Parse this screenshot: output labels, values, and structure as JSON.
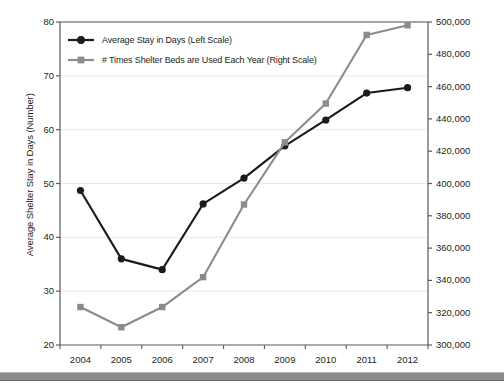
{
  "chart_data": {
    "type": "line",
    "title": "",
    "subtitle": "",
    "xlabel": "",
    "ylabel": "Average Shelter Stay in Days (Number)",
    "y2label": "Annual Number of Times Shelter Beds Used",
    "categories": [
      "2004",
      "2005",
      "2006",
      "2007",
      "2008",
      "2009",
      "2010",
      "2011",
      "2012"
    ],
    "x": [
      2004,
      2005,
      2006,
      2007,
      2008,
      2009,
      2010,
      2011,
      2012
    ],
    "ylim": [
      20,
      80
    ],
    "y2lim": [
      300000,
      500000
    ],
    "yticks": [
      20,
      30,
      40,
      50,
      60,
      70,
      80
    ],
    "y2ticks": [
      300000,
      320000,
      340000,
      360000,
      380000,
      400000,
      420000,
      440000,
      460000,
      480000,
      500000
    ],
    "ytick_labels": [
      "20",
      "30",
      "40",
      "50",
      "60",
      "70",
      "80"
    ],
    "y2tick_labels": [
      "300,000",
      "320,000",
      "340,000",
      "360,000",
      "380,000",
      "400,000",
      "420,000",
      "440,000",
      "460,000",
      "480,000",
      "500,000"
    ],
    "grid": true,
    "legend_position": "top-left",
    "series": [
      {
        "name": "Average Stay in Days (Left Scale)",
        "axis": "left",
        "color": "#1a1a1a",
        "marker": "circle",
        "values": [
          48.7,
          36.0,
          34.0,
          46.2,
          51.0,
          57.0,
          61.8,
          66.8,
          67.8
        ]
      },
      {
        "name": "# Times Shelter Beds are Used Each Year (Right Scale)",
        "axis": "right",
        "color": "#8c8c8c",
        "marker": "square",
        "values": [
          323500,
          311000,
          323500,
          342000,
          387000,
          425500,
          449500,
          492000,
          498000
        ]
      }
    ]
  },
  "legend": {
    "items": [
      {
        "label": "Average Stay in Days (Left Scale)",
        "color": "#1a1a1a",
        "marker": "circle"
      },
      {
        "label": "# Times Shelter Beds are Used Each Year (Right Scale)",
        "color": "#8c8c8c",
        "marker": "square"
      }
    ]
  }
}
